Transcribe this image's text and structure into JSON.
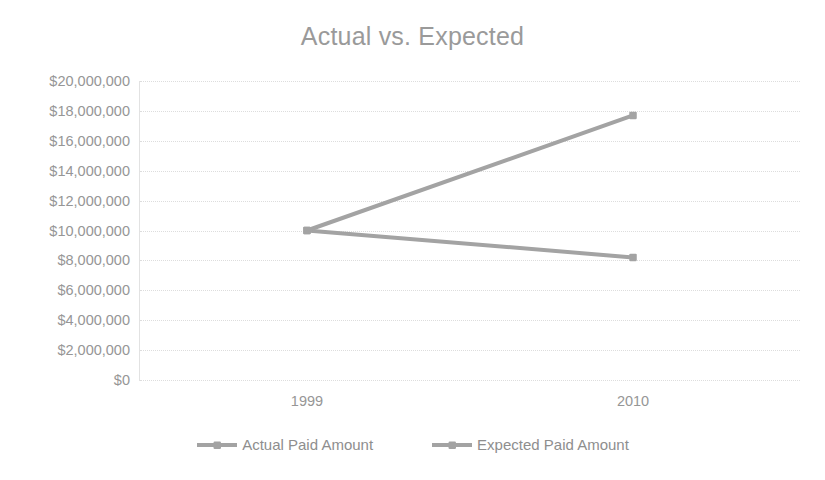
{
  "chart_data": {
    "type": "line",
    "title": "Actual vs. Expected",
    "xlabel": "",
    "ylabel": "",
    "categories": [
      "1999",
      "2010"
    ],
    "series": [
      {
        "name": "Actual Paid Amount",
        "values": [
          10000000,
          8200000
        ],
        "color": "#a3a3a3",
        "marker": "square"
      },
      {
        "name": "Expected Paid Amount",
        "values": [
          10000000,
          17700000
        ],
        "color": "#a3a3a3",
        "marker": "square"
      }
    ],
    "ylim": [
      0,
      20000000
    ],
    "ytick_values": [
      20000000,
      18000000,
      16000000,
      14000000,
      12000000,
      10000000,
      8000000,
      6000000,
      4000000,
      2000000,
      0
    ],
    "ytick_labels": [
      "$20,000,000",
      "$18,000,000",
      "$16,000,000",
      "$14,000,000",
      "$12,000,000",
      "$10,000,000",
      "$8,000,000",
      "$6,000,000",
      "$4,000,000",
      "$2,000,000",
      "$0"
    ],
    "grid": true,
    "grid_color": "#dddddd",
    "legend_position": "bottom",
    "background": "#ffffff",
    "title_color": "#9a9a9a",
    "tick_label_color": "#969696"
  },
  "legend": {
    "items": [
      {
        "label": "Actual Paid Amount"
      },
      {
        "label": "Expected Paid Amount"
      }
    ]
  }
}
